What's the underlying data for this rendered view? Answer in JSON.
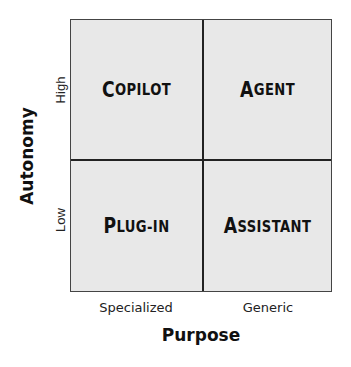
{
  "diagram": {
    "type": "2x2-matrix",
    "x_axis": {
      "title": "Purpose",
      "ticks": [
        "Specialized",
        "Generic"
      ]
    },
    "y_axis": {
      "title": "Autonomy",
      "ticks": [
        "Low",
        "High"
      ]
    },
    "quadrants": {
      "top_left": {
        "first": "C",
        "rest": "OPILOT"
      },
      "top_right": {
        "first": "A",
        "rest": "GENT"
      },
      "bottom_left": {
        "first": "P",
        "rest": "LUG-IN"
      },
      "bottom_right": {
        "first": "A",
        "rest": "SSISTANT"
      }
    },
    "colors": {
      "cell_fill": "#e8e8e8",
      "border": "#444444",
      "text": "#111111"
    }
  }
}
